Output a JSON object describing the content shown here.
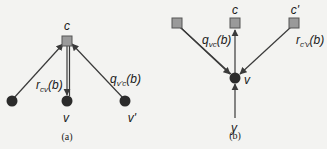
{
  "panel_a": {
    "caption": "(a)",
    "check_node": {
      "label": "c"
    },
    "variable_nodes": [
      {
        "label": ""
      },
      {
        "label": "v"
      },
      {
        "label": "v'"
      }
    ],
    "edge_labels": {
      "left_base": "r",
      "left_sub": "cv",
      "left_arg": "(b)",
      "right_base": "q",
      "right_sub": "v'c",
      "right_arg": "(b)"
    }
  },
  "panel_b": {
    "caption": "(b)",
    "check_nodes": [
      {
        "label": ""
      },
      {
        "label": "c"
      },
      {
        "label": "c'"
      }
    ],
    "variable_node": {
      "label": "v"
    },
    "observation": {
      "label": "y"
    },
    "edge_labels": {
      "left_base": "q",
      "left_sub": "vc",
      "left_arg": "(b)",
      "right_base": "r",
      "right_sub": "c'v",
      "right_arg": "(b)"
    }
  },
  "colors": {
    "square_fill": "#9a9a9a",
    "square_stroke": "#555555",
    "node_fill": "#2b2b2b",
    "edge": "#3a3a3a"
  }
}
